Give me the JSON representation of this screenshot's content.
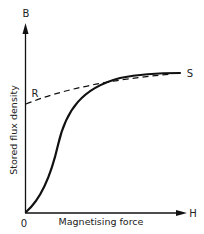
{
  "diagram": {
    "type": "magnetisation-curve",
    "y_axis": {
      "symbol": "B",
      "label": "Stored flux density"
    },
    "x_axis": {
      "symbol": "H",
      "label": "Magnetising force"
    },
    "origin_label": "0",
    "points": {
      "R": {
        "label": "R",
        "description": "remanence point on flux axis (dashed line start)"
      },
      "S": {
        "label": "S",
        "description": "saturation point (curve end)"
      }
    },
    "curves": [
      {
        "name": "magnetisation-curve",
        "style": "solid",
        "description": "S-shaped curve from origin rising to S"
      },
      {
        "name": "demagnetisation-curve",
        "style": "dashed",
        "description": "from R on B-axis rising gently to S"
      }
    ],
    "colors": {
      "ink": "#111111",
      "background": "#ffffff"
    }
  }
}
